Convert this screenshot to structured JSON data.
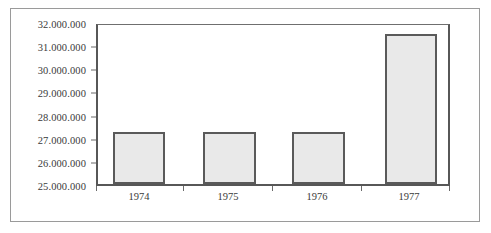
{
  "chart_data": {
    "type": "bar",
    "title": "",
    "subtitle": "",
    "xlabel": "",
    "ylabel": "",
    "categories": [
      "1974",
      "1975",
      "1976",
      "1977"
    ],
    "values": [
      27300000,
      27300000,
      27300000,
      31600000
    ],
    "value_labels": [
      "27.300.000",
      "27.300.000",
      "27.300.000",
      "31.600.000"
    ],
    "ylim": [
      25000000,
      32000000
    ],
    "ytick_labels": [
      "32.000.000",
      "31.000.000",
      "30.000.000",
      "29.000.000",
      "28.000.000",
      "27.000.000",
      "26.000.000",
      "25.000.000"
    ],
    "ytick_values": [
      32000000,
      31000000,
      30000000,
      29000000,
      28000000,
      27000000,
      26000000,
      25000000
    ],
    "grid": false,
    "legend": false,
    "legend_position": "none",
    "number_format": "european-period-thousands",
    "series": [
      {
        "name": "",
        "values": [
          27300000,
          27300000,
          27300000,
          31600000
        ]
      }
    ]
  },
  "style": {
    "bar_fill": "#e9e9e9",
    "bar_border": "#5a5a5a",
    "axis_color": "#575757",
    "tick_color": "#6a6a6a",
    "text_color": "#3a3a3a",
    "frame_color": "#9a9a9a",
    "background": "#ffffff"
  }
}
